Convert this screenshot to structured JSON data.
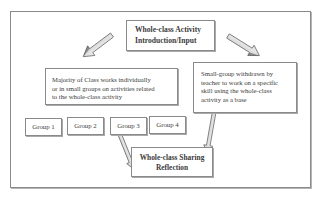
{
  "diagram": {
    "title_box": {
      "lines": [
        "Whole-class Activity",
        "Introduction/Input"
      ]
    },
    "left_box": {
      "lines": [
        "Majority of Class works individually",
        "or in small groups on activities related",
        "to the whole-class activity"
      ]
    },
    "right_box": {
      "lines": [
        "Small-group withdrawn by",
        "teacher to work on a specific",
        "skill using the whole-class",
        "activity as a base"
      ]
    },
    "groups": [
      {
        "label": "Group 1"
      },
      {
        "label": "Group 2"
      },
      {
        "label": "Group 3"
      },
      {
        "label": "Group 4"
      }
    ],
    "bottom_box": {
      "lines": [
        "Whole-class Sharing",
        "Reflection"
      ]
    },
    "arrows": [
      {
        "from": "title_box",
        "to": "left_box"
      },
      {
        "from": "title_box",
        "to": "right_box"
      },
      {
        "from": "group_3",
        "to": "bottom_box"
      },
      {
        "from": "right_box",
        "to": "bottom_box"
      }
    ],
    "colors": {
      "border": "#8a8a8a",
      "text": "#3b3b3b",
      "arrow_fill": "#e6e6e6",
      "arrow_stroke": "#7a7a7a"
    }
  }
}
